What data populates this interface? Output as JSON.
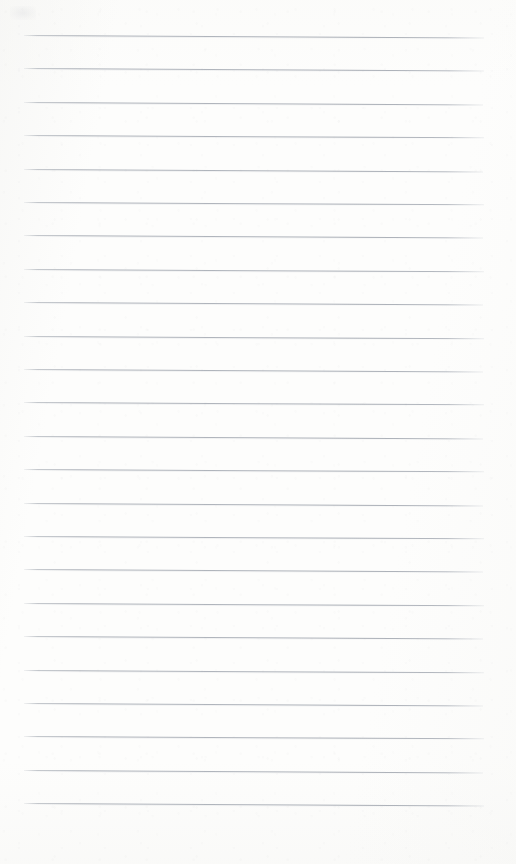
{
  "document": {
    "kind": "scanned-ruled-notebook-page",
    "title": "Blank Ruled Notebook Page",
    "written_content": "",
    "handwriting_present": "no",
    "printed_text_present": "no",
    "page_width_px": 516,
    "page_height_px": 864
  },
  "paper": {
    "background_color": "#fdfdfc",
    "rule_color": "#a7acb4",
    "rule_color_light": "#c4c8cd",
    "rule_thickness_px": 1,
    "rule_count": 24,
    "rule_spacing_px": 33.4,
    "first_rule_y_px": 35,
    "last_rule_y_px": 822,
    "rule_left_x_px": 24,
    "rule_right_x_px": 484,
    "rule_length_px": 460,
    "margin_rule_present": "no",
    "skew_degrees": 0.28
  },
  "rules": [
    {
      "index": 1,
      "y": 35,
      "x": 24,
      "width": 460,
      "skew": 2.4
    },
    {
      "index": 2,
      "y": 68.4,
      "x": 24,
      "width": 460,
      "skew": 2.4
    },
    {
      "index": 3,
      "y": 101.8,
      "x": 24,
      "width": 459,
      "skew": 2.4
    },
    {
      "index": 4,
      "y": 135.2,
      "x": 24,
      "width": 460,
      "skew": 2.3
    },
    {
      "index": 5,
      "y": 168.6,
      "x": 24,
      "width": 459,
      "skew": 2.4
    },
    {
      "index": 6,
      "y": 202.0,
      "x": 24,
      "width": 460,
      "skew": 2.3
    },
    {
      "index": 7,
      "y": 235.4,
      "x": 24,
      "width": 459,
      "skew": 2.4
    },
    {
      "index": 8,
      "y": 268.8,
      "x": 24,
      "width": 460,
      "skew": 2.3
    },
    {
      "index": 9,
      "y": 302.2,
      "x": 24,
      "width": 459,
      "skew": 2.4
    },
    {
      "index": 10,
      "y": 335.6,
      "x": 24,
      "width": 460,
      "skew": 2.3
    },
    {
      "index": 11,
      "y": 369.0,
      "x": 24,
      "width": 459,
      "skew": 2.4
    },
    {
      "index": 12,
      "y": 402.4,
      "x": 24,
      "width": 460,
      "skew": 2.3
    },
    {
      "index": 13,
      "y": 435.8,
      "x": 24,
      "width": 459,
      "skew": 2.4
    },
    {
      "index": 14,
      "y": 469.2,
      "x": 24,
      "width": 460,
      "skew": 2.3
    },
    {
      "index": 15,
      "y": 502.6,
      "x": 24,
      "width": 459,
      "skew": 2.4
    },
    {
      "index": 16,
      "y": 536.0,
      "x": 24,
      "width": 460,
      "skew": 2.3
    },
    {
      "index": 17,
      "y": 569.4,
      "x": 24,
      "width": 459,
      "skew": 2.4
    },
    {
      "index": 18,
      "y": 602.8,
      "x": 24,
      "width": 460,
      "skew": 2.3
    },
    {
      "index": 19,
      "y": 636.2,
      "x": 24,
      "width": 459,
      "skew": 2.4
    },
    {
      "index": 20,
      "y": 669.6,
      "x": 24,
      "width": 460,
      "skew": 2.3
    },
    {
      "index": 21,
      "y": 703.0,
      "x": 24,
      "width": 459,
      "skew": 2.4
    },
    {
      "index": 22,
      "y": 736.4,
      "x": 24,
      "width": 460,
      "skew": 2.3
    },
    {
      "index": 23,
      "y": 769.8,
      "x": 24,
      "width": 459,
      "skew": 2.4
    },
    {
      "index": 24,
      "y": 803.2,
      "x": 24,
      "width": 460,
      "skew": 2.4
    }
  ]
}
